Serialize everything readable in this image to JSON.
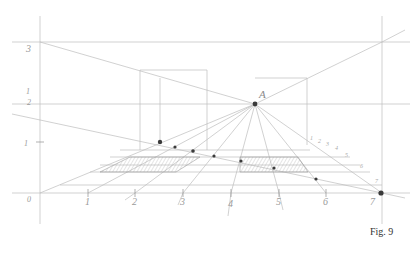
{
  "figure": {
    "caption": "Fig. 9",
    "vanishing_point_label": "A",
    "left_scale_labels": [
      "3",
      "1/2",
      "1",
      "0"
    ],
    "left_scale_label_display": {
      "three": "3",
      "half_top": "1",
      "half_bottom": "2",
      "one": "1",
      "zero": "0"
    },
    "ground_labels": [
      "0",
      "1",
      "2",
      "3",
      "4",
      "5",
      "6",
      "7"
    ],
    "diagonal_tick_labels": [
      "1",
      "2",
      "3",
      "4",
      "5",
      "6",
      "7"
    ],
    "colors": {
      "line": "#b5b5b5",
      "line_dark": "#8a8a8a",
      "dot": "#3a3a3a",
      "hatch": "#9c9c9c",
      "label": "#9a9a9a",
      "caption": "#333333"
    }
  }
}
